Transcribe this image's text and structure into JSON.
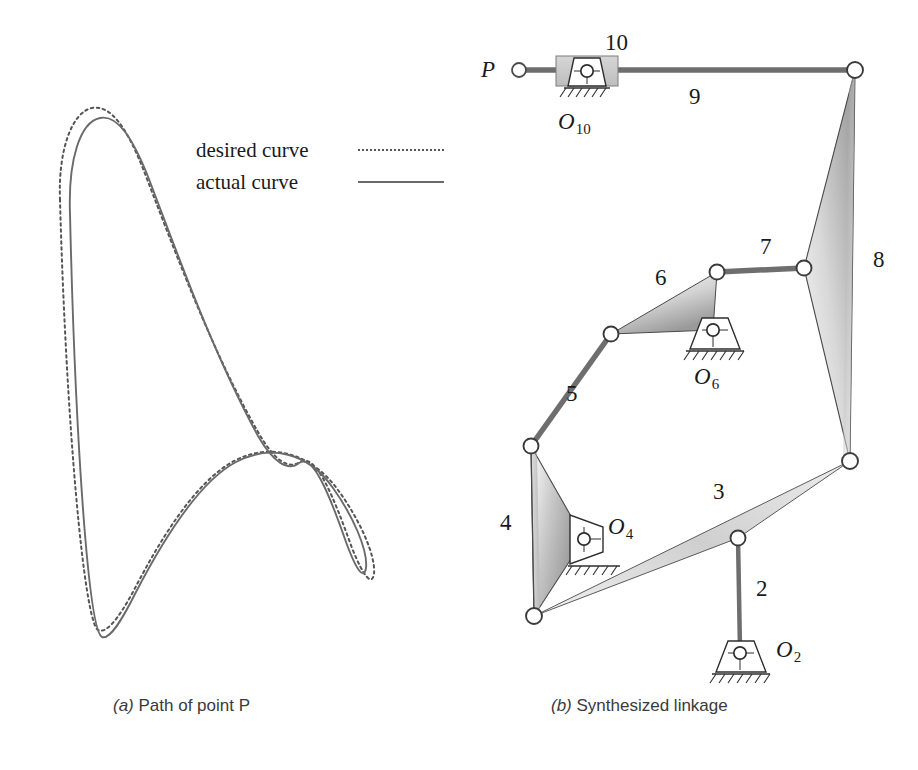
{
  "figure": {
    "panels": [
      {
        "id": "a",
        "caption_prefix": "(a)",
        "caption_text": "Path of point P"
      },
      {
        "id": "b",
        "caption_prefix": "(b)",
        "caption_text": "Synthesized linkage"
      }
    ]
  },
  "legend": {
    "entries": [
      {
        "label": "desired curve",
        "style": "dotted",
        "color": "#555555"
      },
      {
        "label": "actual curve",
        "style": "solid",
        "color": "#6a6a6a"
      }
    ]
  },
  "panel_a": {
    "title": "Path of point P",
    "curves": [
      {
        "name": "desired curve",
        "style": "dotted",
        "path": "M 60 200 C 58 150 72 112 92 108 C 112 104 128 132 142 166 C 170 238 210 348 258 432 C 274 460 288 470 300 462 C 316 452 334 498 352 548 C 364 578 372 586 374 574 C 376 556 360 520 338 490 C 312 454 272 442 236 460 C 196 480 160 540 134 590 C 118 620 106 634 98 630 C 84 622 66 420 60 200 Z"
      },
      {
        "name": "actual curve",
        "style": "solid",
        "path": "M 70 214 C 68 160 80 122 100 118 C 118 114 133 140 147 174 C 174 244 212 352 258 436 C 273 462 288 472 299 463 C 313 453 330 496 346 542 C 357 572 364 580 366 568 C 368 550 353 516 333 488 C 308 452 270 444 236 462 C 198 482 162 542 136 592 C 122 620 110 640 102 637 C 88 630 75 430 70 214 Z"
      }
    ]
  },
  "panel_b": {
    "title": "Synthesized linkage",
    "point_label": "P",
    "links": [
      {
        "id": "2",
        "label": "2",
        "type": "binary-bar"
      },
      {
        "id": "3",
        "label": "3",
        "type": "ternary-shaded"
      },
      {
        "id": "4",
        "label": "4",
        "type": "ternary-shaded"
      },
      {
        "id": "5",
        "label": "5",
        "type": "binary-bar"
      },
      {
        "id": "6",
        "label": "6",
        "type": "ternary-shaded"
      },
      {
        "id": "7",
        "label": "7",
        "type": "binary-bar"
      },
      {
        "id": "8",
        "label": "8",
        "type": "ternary-shaded"
      },
      {
        "id": "9",
        "label": "9",
        "type": "binary-bar"
      },
      {
        "id": "10",
        "label": "10",
        "type": "slider-block"
      }
    ],
    "ground_pivots": [
      {
        "id": "O2",
        "base": "O",
        "sub": "2"
      },
      {
        "id": "O4",
        "base": "O",
        "sub": "4"
      },
      {
        "id": "O6",
        "base": "O",
        "sub": "6"
      },
      {
        "id": "O10",
        "base": "O",
        "sub": "10"
      }
    ],
    "colors": {
      "line": "#3b3b3b",
      "bar": "#6e6e6e",
      "shade_light": "#fcfcfc",
      "shade_dark": "#8d8d8d",
      "slider_fill": "#c9c9c9",
      "joint_fill": "#ffffff"
    }
  }
}
